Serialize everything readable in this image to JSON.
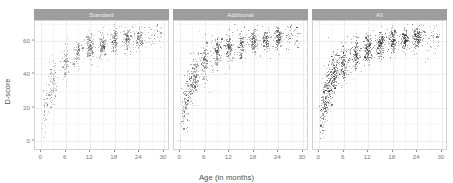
{
  "chart_data": {
    "type": "scatter",
    "title": "",
    "xlabel": "Age (in months)",
    "ylabel": "D-score",
    "xlim": [
      -1.5,
      31.5
    ],
    "ylim": [
      -6,
      72
    ],
    "xticks": [
      0,
      6,
      12,
      18,
      24,
      30
    ],
    "yticks": [
      0,
      20,
      40,
      60
    ],
    "xtick_labels": [
      "0",
      "6",
      "12",
      "18",
      "24",
      "30"
    ],
    "ytick_labels": [
      "0",
      "20",
      "40",
      "60"
    ],
    "grid": true,
    "legend": "none",
    "facet_variable": "instrument_set",
    "facet_labels": [
      "Standard",
      "Additional",
      "All"
    ],
    "point_color": "#2b2b2b",
    "strip_background": "#9d9d9d",
    "strip_text_color": "#f2f2f2",
    "panel_background": "#ffffff",
    "grid_color": "#ededed",
    "panels": [
      {
        "label": "Standard",
        "n_points": 900,
        "density": 0.55,
        "cluster_ages": [
          1,
          2,
          3,
          6,
          9,
          12,
          15,
          18,
          21,
          24
        ],
        "cluster_weights": [
          0.35,
          0.4,
          0.45,
          0.8,
          0.85,
          1.0,
          1.0,
          0.95,
          0.7,
          0.8
        ],
        "seed": 11
      },
      {
        "label": "Additional",
        "n_points": 1150,
        "density": 0.8,
        "cluster_ages": [
          1,
          2,
          3,
          4,
          6,
          9,
          12,
          15,
          18,
          21,
          24
        ],
        "cluster_weights": [
          0.6,
          0.75,
          0.8,
          0.7,
          1.0,
          1.0,
          0.95,
          0.9,
          1.0,
          0.8,
          1.0
        ],
        "seed": 23
      },
      {
        "label": "All",
        "n_points": 1500,
        "density": 1.0,
        "cluster_ages": [
          1,
          2,
          3,
          4,
          6,
          9,
          12,
          15,
          18,
          21,
          24
        ],
        "cluster_weights": [
          0.9,
          1.0,
          1.0,
          0.95,
          1.0,
          1.0,
          1.0,
          1.0,
          1.0,
          0.85,
          1.0
        ],
        "seed": 37
      }
    ],
    "curve": {
      "form": "d = 66.5 * (age/(age+4.4))^0.78 + 3.5",
      "comment": "approximate central tendency of the point cloud"
    }
  },
  "layout": {
    "panel_gap_px": 4,
    "left_margin_px": 34,
    "right_margin_px": 6,
    "top_px": 9,
    "plot_height_px": 130
  }
}
